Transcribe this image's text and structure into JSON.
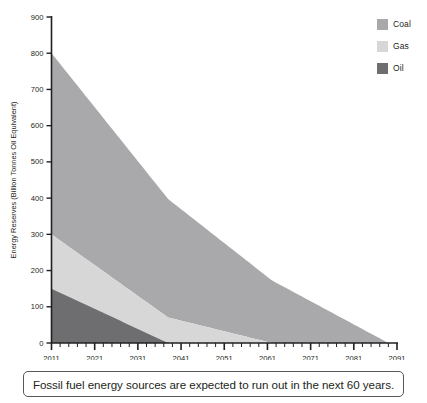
{
  "chart_data": {
    "type": "area",
    "stacked": true,
    "title": "",
    "xlabel": "",
    "ylabel": "Energy Reserves (Billion Tonnes Oil Equivalent)",
    "xlim": [
      2011,
      2091
    ],
    "ylim": [
      0,
      900
    ],
    "grid": false,
    "legend_position": "top-right",
    "x_ticks": [
      2011,
      2021,
      2031,
      2041,
      2051,
      2061,
      2071,
      2081,
      2091
    ],
    "x_tick_labels": [
      "2011",
      "2021",
      "2031",
      "2041",
      "2051",
      "2061",
      "2071",
      "2081",
      "2091"
    ],
    "x_minor_tick_step": 2,
    "y_ticks": [
      0,
      100,
      200,
      300,
      400,
      500,
      600,
      700,
      800,
      900
    ],
    "y_tick_labels": [
      "0",
      "100",
      "200",
      "300",
      "400",
      "500",
      "600",
      "700",
      "800",
      "900"
    ],
    "series": [
      {
        "name": "Oil",
        "color": "#6e6e70",
        "start_value": 150,
        "depletion_year": 2038,
        "points": [
          {
            "x": 2011,
            "y": 150
          },
          {
            "x": 2038,
            "y": 0
          },
          {
            "x": 2091,
            "y": 0
          }
        ]
      },
      {
        "name": "Gas",
        "color": "#d7d7d8",
        "start_value": 150,
        "depletion_year": 2062,
        "points": [
          {
            "x": 2011,
            "y": 150
          },
          {
            "x": 2062,
            "y": 0
          },
          {
            "x": 2091,
            "y": 0
          }
        ]
      },
      {
        "name": "Coal",
        "color": "#a9a9ab",
        "start_value": 500,
        "depletion_year": 2089,
        "points": [
          {
            "x": 2011,
            "y": 500
          },
          {
            "x": 2089,
            "y": 0
          },
          {
            "x": 2091,
            "y": 0
          }
        ]
      }
    ],
    "cumulative_top_at_start": {
      "oil": 150,
      "gas": 300,
      "coal": 800
    },
    "annotations": []
  },
  "legend": {
    "items": [
      {
        "label": "Coal",
        "color": "#a9a9ab"
      },
      {
        "label": "Gas",
        "color": "#d7d7d8"
      },
      {
        "label": "Oil",
        "color": "#6e6e70"
      }
    ]
  },
  "caption": {
    "text": "Fossil fuel energy sources are expected to run out in the next 60 years."
  },
  "colors": {
    "axis": "#231f20",
    "text": "#231f20",
    "caption_border": "#58585a",
    "background": "#ffffff"
  }
}
